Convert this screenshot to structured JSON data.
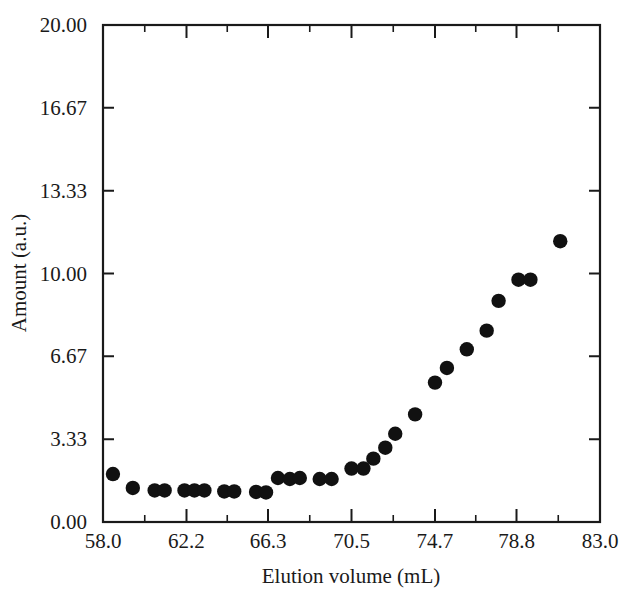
{
  "chart_data": {
    "type": "scatter",
    "title": "",
    "xlabel": "Elution volume (mL)",
    "ylabel": "Amount (a.u.)",
    "xlim": [
      58.0,
      83.0
    ],
    "ylim": [
      0.0,
      20.0
    ],
    "grid": false,
    "legend": null,
    "marker": "filled-circle",
    "marker_color": "#111111",
    "xticks": [
      "58.0",
      "62.2",
      "66.3",
      "70.5",
      "74.7",
      "78.8",
      "83.0"
    ],
    "xtick_values": [
      58.0,
      62.2,
      66.3,
      70.5,
      74.7,
      78.8,
      83.0
    ],
    "yticks": [
      "0.00",
      "3.33",
      "6.67",
      "10.00",
      "13.33",
      "16.67",
      "20.00"
    ],
    "ytick_values": [
      0.0,
      3.33,
      6.67,
      10.0,
      13.33,
      16.67,
      20.0
    ],
    "minor_ticks_x": true,
    "minor_ticks_y": false,
    "series": [
      {
        "name": "Amount",
        "x": [
          58.5,
          59.5,
          60.6,
          61.1,
          62.1,
          62.6,
          63.1,
          64.1,
          64.6,
          65.7,
          66.2,
          66.8,
          67.4,
          67.9,
          68.9,
          69.5,
          70.5,
          71.1,
          71.6,
          72.2,
          72.7,
          73.7,
          74.7,
          75.3,
          76.3,
          77.3,
          77.9,
          78.9,
          79.5,
          81.0
        ],
        "y": [
          1.93,
          1.37,
          1.27,
          1.27,
          1.27,
          1.27,
          1.27,
          1.23,
          1.23,
          1.21,
          1.19,
          1.77,
          1.73,
          1.77,
          1.73,
          1.73,
          2.15,
          2.15,
          2.55,
          2.99,
          3.55,
          4.33,
          5.61,
          6.2,
          6.95,
          7.7,
          8.9,
          9.75,
          9.75,
          11.3
        ]
      }
    ]
  },
  "axes": {
    "ylabel": "Amount (a.u.)",
    "xlabel": "Elution volume (mL)"
  }
}
